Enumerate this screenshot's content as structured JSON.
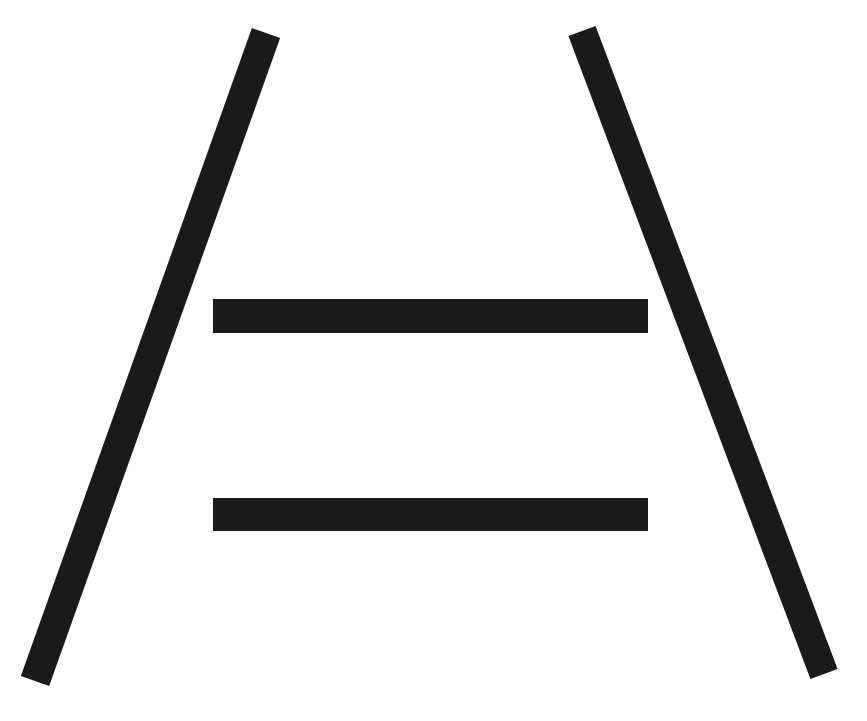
{
  "figure": {
    "type": "ponzo-illusion",
    "width": 867,
    "height": 721,
    "background": "#ffffff",
    "ink_color": "#1a1a1a",
    "converging_lines": [
      {
        "name": "left-rail",
        "x1": 266,
        "y1": 33,
        "x2": 35,
        "y2": 681,
        "width": 30
      },
      {
        "name": "right-rail",
        "x1": 582,
        "y1": 31,
        "x2": 824,
        "y2": 674,
        "width": 29
      }
    ],
    "horizontal_bars": [
      {
        "name": "upper-bar",
        "x": 213,
        "y": 299,
        "width": 435,
        "height": 34
      },
      {
        "name": "lower-bar",
        "x": 213,
        "y": 498,
        "width": 435,
        "height": 33
      }
    ]
  }
}
